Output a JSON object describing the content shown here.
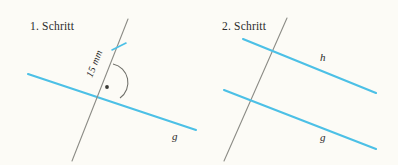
{
  "figure": {
    "background_color": "#fdfcf8",
    "blue_color": "#4cc0e6",
    "gray_color": "#8c8c86",
    "text_color": "#2b2b2b",
    "width": 398,
    "height": 165
  },
  "panels": [
    {
      "id": "panel-1",
      "caption": "1. Schritt",
      "caption_pos": {
        "x": 30,
        "y": 30
      },
      "elements": {
        "line_g": {
          "label": "g",
          "label_pos": {
            "x": 172,
            "y": 138
          },
          "x1": 28,
          "y1": 74,
          "x2": 196,
          "y2": 130
        },
        "transversal": {
          "label": "",
          "x1": 128,
          "y1": 19,
          "x2": 72,
          "y2": 161
        },
        "measure": {
          "label": "15 mm",
          "label_pos": {
            "x": 92,
            "y": 76
          },
          "rotation": -68
        },
        "tick_mark": {
          "x1": 113,
          "y1": 49,
          "x2": 125,
          "y2": 44
        },
        "right_angle": {
          "marker": "right-angle-dot",
          "arc_center": {
            "x": 101,
            "y": 92
          },
          "arc_radius": 16,
          "dot_pos": {
            "x": 106,
            "y": 87
          },
          "dot_radius": 1.9
        }
      }
    },
    {
      "id": "panel-2",
      "caption": "2. Schritt",
      "caption_pos": {
        "x": 222,
        "y": 30
      },
      "elements": {
        "line_h": {
          "label": "h",
          "label_pos": {
            "x": 320,
            "y": 60
          },
          "x1": 243,
          "y1": 39,
          "x2": 374,
          "y2": 92
        },
        "line_g": {
          "label": "g",
          "label_pos": {
            "x": 320,
            "y": 139
          },
          "x1": 224,
          "y1": 90,
          "x2": 374,
          "y2": 148
        },
        "transversal": {
          "label": "",
          "x1": 287,
          "y1": 18,
          "x2": 224,
          "y2": 161
        }
      }
    }
  ],
  "legend": {
    "units": "mm",
    "distance_value": "15",
    "line_names": [
      "g",
      "h"
    ]
  }
}
